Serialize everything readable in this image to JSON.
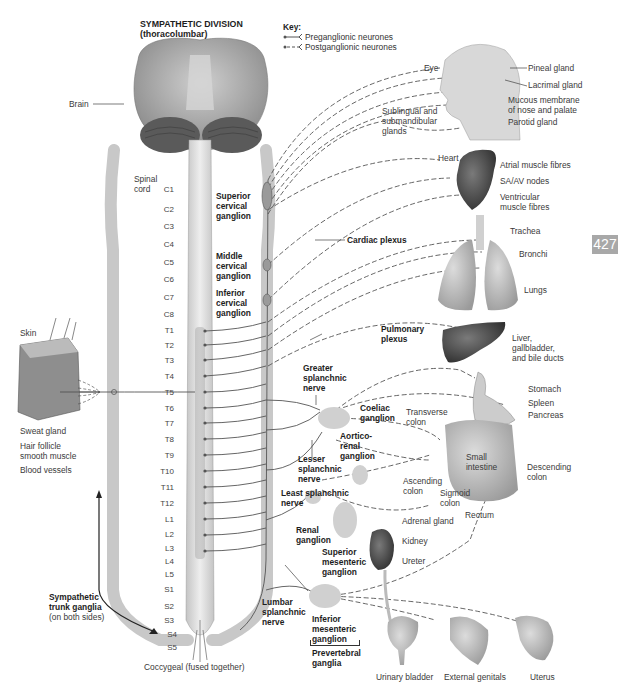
{
  "title": {
    "line1": "SYMPATHETIC DIVISION",
    "line2": "(thoracolumbar)"
  },
  "key": {
    "heading": "Key:",
    "items": [
      {
        "label": "Preganglionic neurones",
        "style": "solid"
      },
      {
        "label": "Postganglionic neurones",
        "style": "dashed"
      }
    ]
  },
  "page_number": "427",
  "spinal_segments": [
    "C1",
    "C2",
    "C3",
    "C4",
    "C5",
    "C6",
    "C7",
    "C8",
    "T1",
    "T2",
    "T3",
    "T4",
    "T5",
    "T6",
    "T7",
    "T8",
    "T9",
    "T10",
    "T11",
    "T12",
    "L1",
    "L2",
    "L3",
    "L4",
    "L5",
    "S1",
    "S2",
    "S3",
    "S4",
    "S5"
  ],
  "left_labels": {
    "brain": "Brain",
    "spinal_cord": "Spinal\ncord",
    "skin": "Skin",
    "sweat_gland": "Sweat gland",
    "hair_follicle": "Hair follicle\nsmooth muscle",
    "blood_vessels": "Blood vessels",
    "trunk_ganglia": "Sympathetic\ntrunk ganglia",
    "trunk_ganglia_note": "(on both sides)",
    "coccygeal": "Coccygeal (fused together)"
  },
  "ganglia_labels": {
    "superior_cervical": "Superior\ncervical\nganglion",
    "middle_cervical": "Middle\ncervical\nganglion",
    "inferior_cervical": "Inferior\ncervical\nganglion",
    "cardiac_plexus": "Cardiac plexus",
    "pulmonary_plexus": "Pulmonary\nplexus",
    "greater_splanchnic": "Greater\nsplanchnic\nnerve",
    "coeliac": "Coeliac\nganglion",
    "aorticorenal": "Aortico-\nrenal\nganglion",
    "lesser_splanchnic": "Lesser\nsplanchnic\nnerve",
    "least_splanchnic": "Least splanchnic\nnerve",
    "renal": "Renal\nganglion",
    "superior_mesenteric": "Superior\nmesenteric\nganglion",
    "lumbar_splanchnic": "Lumbar\nsplanchnic\nnerve",
    "inferior_mesenteric": "Inferior\nmesenteric\nganglion",
    "prevertebral": "Prevertebral\nganglia"
  },
  "organ_labels": {
    "eye": "Eye",
    "pineal": "Pineal gland",
    "lacrimal": "Lacrimal gland",
    "mucous": "Mucous membrane\nof nose and palate",
    "sublingual": "Sublingual and\nsubmandibular\nglands",
    "parotid": "Parotid gland",
    "heart": "Heart",
    "atrial": "Atrial muscle fibres",
    "saav": "SA/AV nodes",
    "ventricular": "Ventricular\nmuscle fibres",
    "trachea": "Trachea",
    "bronchi": "Bronchi",
    "lungs": "Lungs",
    "liver": "Liver,\ngallbladder,\nand bile ducts",
    "stomach": "Stomach",
    "spleen": "Spleen",
    "pancreas": "Pancreas",
    "transverse_colon": "Transverse\ncolon",
    "small_intestine": "Small\nintestine",
    "ascending_colon": "Ascending\ncolon",
    "sigmoid_colon": "Sigmoid\ncolon",
    "descending_colon": "Descending\ncolon",
    "rectum": "Rectum",
    "adrenal": "Adrenal gland",
    "kidney": "Kidney",
    "ureter": "Ureter",
    "bladder": "Urinary bladder",
    "genitals": "External genitals",
    "uterus": "Uterus"
  },
  "colors": {
    "nerve": "#555555",
    "tissue": "#d6d6d6",
    "ganglion_fill": "#cfcfcf",
    "badge": "#a8a8a8",
    "organ_dark": "#4a4a4a"
  }
}
